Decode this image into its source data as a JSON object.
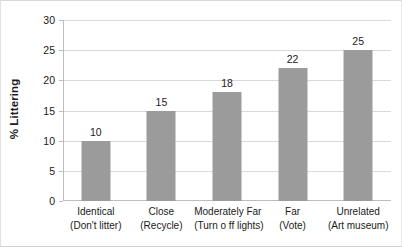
{
  "chart_data": {
    "type": "bar",
    "title": "",
    "subtitle": "",
    "xlabel": "",
    "ylabel": "% Littering",
    "ylim": [
      0,
      30
    ],
    "yticks": [
      0,
      5,
      10,
      15,
      20,
      25,
      30
    ],
    "ytick_labels": [
      "0",
      "5",
      "10",
      "15",
      "20",
      "25",
      "30"
    ],
    "grid": true,
    "legend": false,
    "legend_position": "none",
    "bar_color": "#9b9b9b",
    "categories": [
      "Identical\n(Don't litter)",
      "Close\n(Recycle)",
      "Moderately Far\n(Turn o ff lights)",
      "Far\n(Vote)",
      "Unrelated\n(Art museum)"
    ],
    "category_lines": [
      [
        "Identical",
        "(Don't litter)"
      ],
      [
        "Close",
        "(Recycle)"
      ],
      [
        "Moderately Far",
        "(Turn o ff lights)"
      ],
      [
        "Far",
        "(Vote)"
      ],
      [
        "Unrelated",
        "(Art museum)"
      ]
    ],
    "values": [
      10,
      15,
      18,
      22,
      25
    ],
    "data_labels": [
      "10",
      "15",
      "18",
      "22",
      "25"
    ]
  },
  "axis": {
    "y_title": "% Littering"
  }
}
